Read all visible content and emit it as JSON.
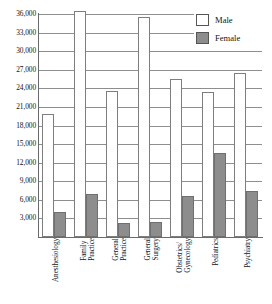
{
  "chart_data": {
    "type": "bar",
    "title": "",
    "subtitle": "",
    "xlabel": "",
    "ylabel": "",
    "categories": [
      "Anesthesiology",
      "Family Practice",
      "General Practice",
      "General Surgery",
      "Obstetrics/ Gynecology",
      "Pediatrics",
      "Psychiatry"
    ],
    "category_lines": [
      [
        "Anesthesiology"
      ],
      [
        "Family",
        "Practice"
      ],
      [
        "General",
        "Practice"
      ],
      [
        "General",
        "Surgery"
      ],
      [
        "Obstetrics/",
        "Gynecology"
      ],
      [
        "Pediatrics"
      ],
      [
        "Psychiatry"
      ]
    ],
    "series": [
      {
        "name": "Male",
        "color": "#ffffff",
        "values": [
          19800,
          36500,
          23500,
          35500,
          25500,
          23400,
          26500
        ]
      },
      {
        "name": "Female",
        "color": "#8d8d8d",
        "values": [
          4100,
          7000,
          2300,
          2400,
          6700,
          13500,
          7400
        ]
      }
    ],
    "ylim": [
      0,
      36000
    ],
    "ytick_values": [
      3000,
      6000,
      9000,
      12000,
      15000,
      18000,
      21000,
      24000,
      27000,
      30000,
      33000,
      36000
    ],
    "ytick_labels": [
      "3,000",
      "6,000",
      "9,000",
      "12,000",
      "15,000",
      "18,000",
      "21,000",
      "24,000",
      "27,000",
      "30,000",
      "33,000",
      "36,000"
    ],
    "grid": true,
    "grid_axis": "y",
    "legend_position": "top-right"
  },
  "legend": {
    "entries": [
      {
        "label": "Male",
        "swatch": "male"
      },
      {
        "label": "Female",
        "swatch": "female"
      }
    ]
  }
}
